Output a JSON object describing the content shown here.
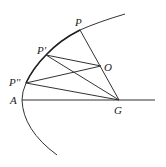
{
  "diagram": {
    "type": "geometric-construction",
    "colors": {
      "stroke": "#333333",
      "background": "#ffffff"
    },
    "points": {
      "P": {
        "label": "P",
        "x": 80,
        "y": 30
      },
      "P1": {
        "label": "P'",
        "x": 46,
        "y": 55
      },
      "P2": {
        "label": "P''",
        "x": 26,
        "y": 83
      },
      "O": {
        "label": "O",
        "x": 101,
        "y": 66
      },
      "A": {
        "label": "A",
        "x": 22,
        "y": 100
      },
      "G": {
        "label": "G",
        "x": 119,
        "y": 100
      }
    },
    "labels": {
      "P": "P",
      "P1": "P'",
      "P2": "P''",
      "O": "O",
      "A": "A",
      "G": "G"
    },
    "segments": [
      [
        "P",
        "G"
      ],
      [
        "P1",
        "O"
      ],
      [
        "P1",
        "G"
      ],
      [
        "P2",
        "O"
      ],
      [
        "P2",
        "G"
      ],
      [
        "P",
        "P1"
      ],
      [
        "P1",
        "P2"
      ]
    ],
    "axis": {
      "from": [
        22,
        100
      ],
      "to": [
        155,
        100
      ]
    },
    "curve": "parabola-like arc through P, P', P'', A"
  }
}
